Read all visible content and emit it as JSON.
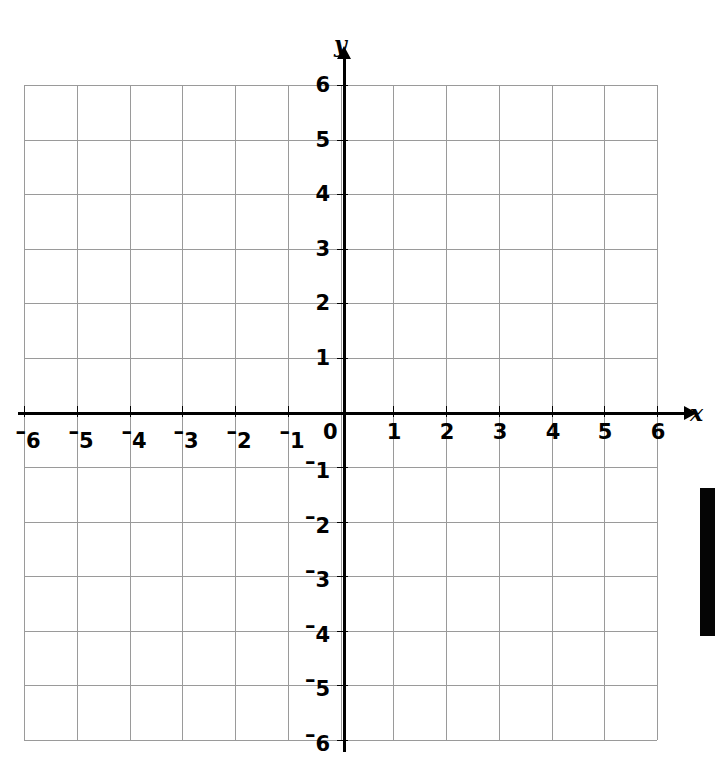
{
  "chart_data": {
    "type": "scatter",
    "title": "",
    "subtitle": "",
    "xlabel": "x",
    "ylabel": "y",
    "xlim": [
      -6,
      6
    ],
    "ylim": [
      -6,
      6
    ],
    "x_ticks": [
      -6,
      -5,
      -4,
      -3,
      -2,
      -1,
      0,
      1,
      2,
      3,
      4,
      5,
      6
    ],
    "y_ticks": [
      6,
      5,
      4,
      3,
      2,
      1,
      0,
      -1,
      -2,
      -3,
      -4,
      -5,
      -6
    ],
    "x_tick_labels": [
      "–6",
      "–5",
      "–4",
      "–3",
      "–2",
      "–1",
      "0",
      "1",
      "2",
      "3",
      "4",
      "5",
      "6"
    ],
    "y_tick_labels": [
      "6",
      "5",
      "4",
      "3",
      "2",
      "1",
      "0",
      "–1",
      "–2",
      "–3",
      "–4",
      "–5",
      "–6"
    ],
    "grid": true,
    "legend": null,
    "series": [],
    "values": [],
    "annotations": []
  },
  "axes": {
    "x_label": "x",
    "y_label": "y",
    "origin_label": "0",
    "negative_sign": "–",
    "x_tick_values": [
      -6,
      -5,
      -4,
      -3,
      -2,
      -1,
      1,
      2,
      3,
      4,
      5,
      6
    ],
    "y_tick_values": [
      6,
      5,
      4,
      3,
      2,
      1,
      -1,
      -2,
      -3,
      -4,
      -5,
      -6
    ]
  },
  "colors": {
    "grid": "#9a9a9a",
    "axis": "#000000",
    "background": "#ffffff",
    "label": "#000000",
    "edge_bar": "#050505"
  }
}
